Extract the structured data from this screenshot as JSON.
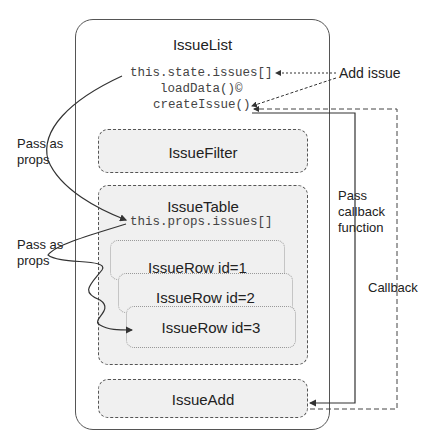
{
  "issue_list": {
    "title": "IssueList",
    "state": "this.state.issues[]",
    "load": "loadData()©",
    "create": "createIssue()"
  },
  "issue_filter": {
    "title": "IssueFilter"
  },
  "issue_table": {
    "title": "IssueTable",
    "props": "this.props.issues[]",
    "rows": [
      "IssueRow id=1",
      "IssueRow id=2",
      "IssueRow id=3"
    ]
  },
  "issue_add": {
    "title": "IssueAdd"
  },
  "labels": {
    "add_issue": "Add issue",
    "pass_props_1": "Pass as props",
    "pass_props_2": "Pass as props",
    "pass_callback": "Pass callback function",
    "callback": "Callback"
  }
}
